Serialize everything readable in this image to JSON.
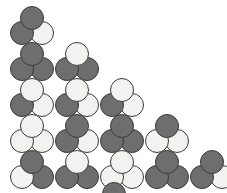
{
  "figure": {
    "title": "",
    "width": 227,
    "height": 193,
    "background_color": "#ffffff",
    "colors": {
      "dark": "#6e6e6e",
      "light": "#f2f2f0",
      "outline": "#3a3a3a"
    },
    "legend": {
      "dark_label": "",
      "light_label": ""
    },
    "layout": {
      "rows": 5,
      "cluster_counts": [
        1,
        2,
        3,
        4,
        5
      ],
      "row_spacing": 36,
      "column_spacing": 45,
      "origin_x": 10,
      "origin_y": 6
    },
    "rows": [
      {
        "index": 0,
        "clusters": [
          {
            "id": "r0c0",
            "top": "dark",
            "bottom_left": "dark",
            "bottom_right": "light"
          }
        ]
      },
      {
        "index": 1,
        "clusters": [
          {
            "id": "r1c0",
            "top": "dark",
            "bottom_left": "dark",
            "bottom_right": "dark"
          },
          {
            "id": "r1c1",
            "top": "light",
            "bottom_left": "dark",
            "bottom_right": "dark"
          }
        ]
      },
      {
        "index": 2,
        "clusters": [
          {
            "id": "r2c0",
            "top": "light",
            "bottom_left": "dark",
            "bottom_right": "light"
          },
          {
            "id": "r2c1",
            "top": "light",
            "bottom_left": "dark",
            "bottom_right": "light"
          },
          {
            "id": "r2c2",
            "top": "light",
            "bottom_left": "dark",
            "bottom_right": "light"
          }
        ]
      },
      {
        "index": 3,
        "clusters": [
          {
            "id": "r3c0",
            "top": "light",
            "bottom_left": "light",
            "bottom_right": "light"
          },
          {
            "id": "r3c1",
            "top": "dark",
            "bottom_left": "dark",
            "bottom_right": "light"
          },
          {
            "id": "r3c2",
            "top": "dark",
            "bottom_left": "dark",
            "bottom_right": "dark"
          },
          {
            "id": "r3c3",
            "top": "dark",
            "bottom_left": "light",
            "bottom_right": "light"
          }
        ]
      },
      {
        "index": 4,
        "clusters": [
          {
            "id": "r4c0",
            "top": "dark",
            "bottom_left": "light",
            "bottom_right": "dark"
          },
          {
            "id": "r4c1",
            "top": "light",
            "bottom_left": "dark",
            "bottom_right": "dark"
          },
          {
            "id": "r4c2",
            "top": "light",
            "bottom_left": "light",
            "bottom_right": "light"
          },
          {
            "id": "r4c3",
            "top": "dark",
            "bottom_left": "dark",
            "bottom_right": "dark"
          },
          {
            "id": "r4c4",
            "top": "dark",
            "bottom_left": "dark",
            "bottom_right": "light"
          }
        ]
      }
    ],
    "partial_cluster": {
      "id": "partial",
      "top": "dark",
      "bottom_left": "dark",
      "bottom_right": "dark",
      "note": "clipped at bottom edge"
    }
  }
}
